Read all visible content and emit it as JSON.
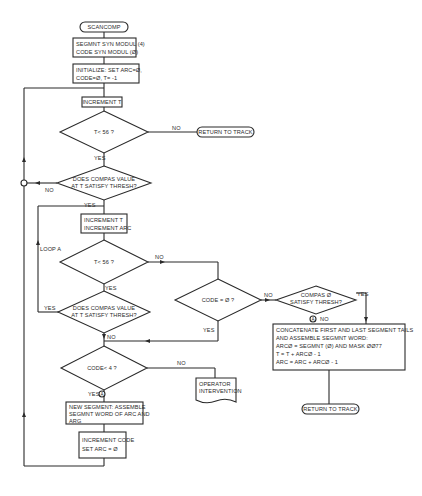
{
  "nodes": {
    "start": "SCANCOMP",
    "segmnt_modul": [
      "SEGMNT SYN MODUL (4)",
      "CODE SYN MODUL (Ø)"
    ],
    "initialize": [
      "INITIALIZE:  SET ARC=Ø,",
      "CODE=Ø, T= -1"
    ],
    "increment_t": "INCREMENT T",
    "t_lt_56_1": "T< 56 ?",
    "return_track_1": "RETURN TO TRACK",
    "compas_thresh_1": [
      "DOES COMPAS VALUE",
      "AT T SATISFY THRESH?"
    ],
    "increment_t_arc": [
      "INCREMENT T",
      "INCREMENT ARC"
    ],
    "loop_a": "LOOP A",
    "t_lt_56_2": "T< 56 ?",
    "code_eq_0": "CODE = Ø  ?",
    "compas_0_thresh": [
      "COMPAS  Ø",
      "SATISFY THRESH?"
    ],
    "compas_thresh_2": [
      "DOES COMPAS VALUE",
      "AT T SATISFY THRESH?"
    ],
    "concatenate": [
      "CONCATENATE FIRST AND LAST SEGMENT TAILS",
      "AND ASSEMBLE SEGMNT WORD:",
      "ARCØ   = SEGMNT (Ø) AND MASK ØØ77",
      "T = T + ARCØ - 1",
      "ARC = ARC + ARCØ - 1"
    ],
    "return_track_2": "RETURN TO TRACK",
    "code_lt_4": "CODE< 4 ?",
    "operator_intervention": [
      "OPERATOR",
      "INTERVENTION"
    ],
    "new_segment": [
      "NEW SEGMENT:  ASSEMBLE",
      "SEGMNT WORD OF ARC AND",
      "ARG"
    ],
    "increment_code": [
      "INCREMENT CODE",
      "SET ARC = Ø"
    ]
  },
  "labels": {
    "yes": "YES",
    "no": "NO",
    "connector_a": "A"
  }
}
